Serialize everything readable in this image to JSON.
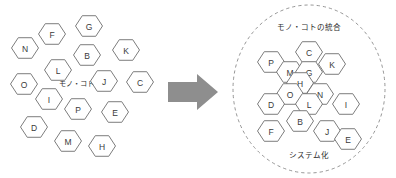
{
  "figure": {
    "background_color": "#ffffff",
    "hex_stroke_color": "#6e6e6e",
    "hex_fill_color": "#ffffff",
    "label_color": "#3a3a3a",
    "arrow_color": "#8e8e8e",
    "ring_color": "#8a8a8a"
  },
  "left_cluster": {
    "name": "scattered-hexagons",
    "center_label": "モノ・コト",
    "center_label_x": 76,
    "center_label_y": 83,
    "hex_radius": 13.5,
    "nodes": [
      {
        "label": "N",
        "cx": 25,
        "cy": 48
      },
      {
        "label": "F",
        "cx": 52,
        "cy": 34
      },
      {
        "label": "G",
        "cx": 89,
        "cy": 26
      },
      {
        "label": "B",
        "cx": 87,
        "cy": 55
      },
      {
        "label": "K",
        "cx": 126,
        "cy": 50
      },
      {
        "label": "L",
        "cx": 58,
        "cy": 70
      },
      {
        "label": "O",
        "cx": 24,
        "cy": 84
      },
      {
        "label": "J",
        "cx": 104,
        "cy": 81
      },
      {
        "label": "C",
        "cx": 140,
        "cy": 82
      },
      {
        "label": "I",
        "cx": 49,
        "cy": 99
      },
      {
        "label": "P",
        "cx": 78,
        "cy": 109
      },
      {
        "label": "E",
        "cx": 115,
        "cy": 112
      },
      {
        "label": "D",
        "cx": 34,
        "cy": 127
      },
      {
        "label": "M",
        "cx": 68,
        "cy": 141
      },
      {
        "label": "H",
        "cx": 102,
        "cy": 146
      }
    ]
  },
  "arrow": {
    "name": "transform-arrow",
    "direction": "right"
  },
  "right_cluster": {
    "name": "integrated-honeycomb",
    "top_caption": "モノ・コトの統合",
    "bottom_caption": "システム化",
    "top_caption_x": 309,
    "top_caption_y": 27,
    "bottom_caption_x": 309,
    "bottom_caption_y": 155,
    "ring": {
      "cx": 309,
      "cy": 89,
      "rx": 76,
      "ry": 84
    },
    "hex_radius": 13.5,
    "nodes": [
      {
        "label": "C",
        "cx": 309,
        "cy": 52
      },
      {
        "label": "P",
        "cx": 271,
        "cy": 62
      },
      {
        "label": "K",
        "cx": 332,
        "cy": 64
      },
      {
        "label": "M",
        "cx": 290,
        "cy": 72
      },
      {
        "label": "G",
        "cx": 309,
        "cy": 72
      },
      {
        "label": "H",
        "cx": 300,
        "cy": 83
      },
      {
        "label": "O",
        "cx": 290,
        "cy": 94
      },
      {
        "label": "N",
        "cx": 320,
        "cy": 94
      },
      {
        "label": "D",
        "cx": 271,
        "cy": 104
      },
      {
        "label": "L",
        "cx": 309,
        "cy": 104
      },
      {
        "label": "I",
        "cx": 346,
        "cy": 104
      },
      {
        "label": "B",
        "cx": 300,
        "cy": 121
      },
      {
        "label": "F",
        "cx": 271,
        "cy": 131
      },
      {
        "label": "J",
        "cx": 327,
        "cy": 131
      },
      {
        "label": "E",
        "cx": 348,
        "cy": 139
      }
    ]
  }
}
